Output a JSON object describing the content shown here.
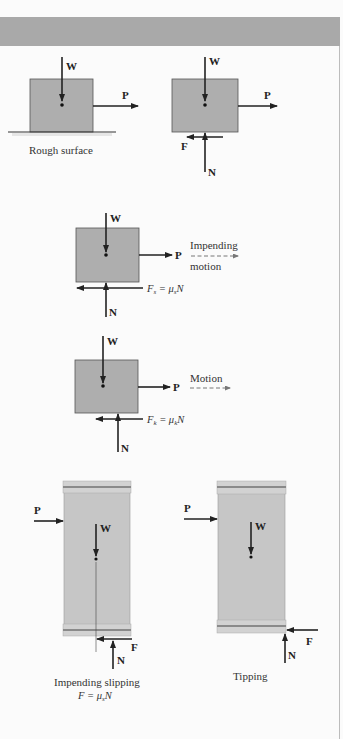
{
  "figure": {
    "panels": [
      {
        "id": "rough-surface",
        "caption": "Rough surface",
        "labels": {
          "weight": "W",
          "push": "P"
        }
      },
      {
        "id": "free-body",
        "labels": {
          "weight": "W",
          "push": "P",
          "friction": "F",
          "normal": "N"
        }
      },
      {
        "id": "impending-motion",
        "labels": {
          "weight": "W",
          "push": "P",
          "normal": "N",
          "friction_eq_lhs": "F",
          "friction_eq_sub": "s",
          "friction_eq_mid": " = μ",
          "friction_eq_sub2": "s",
          "friction_eq_rhs": "N"
        },
        "motion_label_line1": "Impending",
        "motion_label_line2": "motion"
      },
      {
        "id": "motion",
        "labels": {
          "weight": "W",
          "push": "P",
          "normal": "N",
          "friction_eq_lhs": "F",
          "friction_eq_sub": "k",
          "friction_eq_mid": " = μ",
          "friction_eq_sub2": "k",
          "friction_eq_rhs": "N"
        },
        "motion_label": "Motion"
      },
      {
        "id": "impending-slipping",
        "caption": "Impending slipping",
        "equation": {
          "lhs": "F",
          "mid": " = μ",
          "sub": "s",
          "rhs": "N"
        },
        "labels": {
          "weight": "W",
          "push": "P",
          "friction": "F",
          "normal": "N"
        }
      },
      {
        "id": "tipping",
        "caption": "Tipping",
        "labels": {
          "weight": "W",
          "push": "P",
          "friction": "F",
          "normal": "N"
        }
      }
    ]
  },
  "colors": {
    "band": "#a9a9a9",
    "block_fill": "#aeaeae",
    "tall_block_fill": "#c6c6c6",
    "cap_fill": "#d2d2d2",
    "cap_stripe": "#8a8a8a",
    "arrow": "#222222",
    "dashed_arrow": "#777777"
  }
}
